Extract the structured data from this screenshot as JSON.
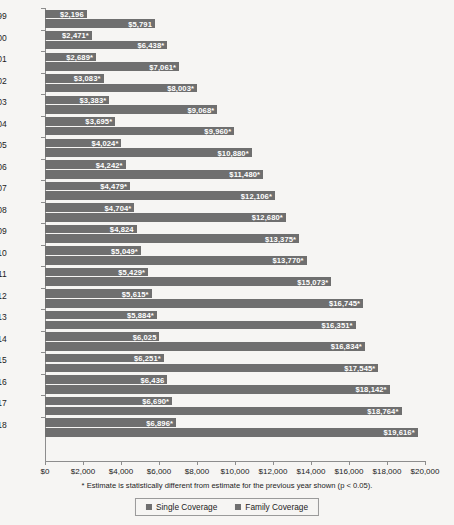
{
  "chart_data": {
    "type": "bar",
    "orientation": "horizontal",
    "title": "",
    "xlabel": "",
    "ylabel": "",
    "xlim": [
      0,
      20000
    ],
    "xticks": [
      0,
      2000,
      4000,
      6000,
      8000,
      10000,
      12000,
      14000,
      16000,
      18000,
      20000
    ],
    "xtick_labels": [
      "$0",
      "$2,000",
      "$4,000",
      "$6,000",
      "$8,000",
      "$10,000",
      "$12,000",
      "$14,000",
      "$16,000",
      "$18,000",
      "$20,000"
    ],
    "grid": false,
    "legend_position": "bottom",
    "categories": [
      "1999",
      "2000",
      "2001",
      "2002",
      "2003",
      "2004",
      "2005",
      "2006",
      "2007",
      "2008",
      "2009",
      "2010",
      "2011",
      "2012",
      "2013",
      "2014",
      "2015",
      "2016",
      "2017",
      "2018"
    ],
    "series": [
      {
        "name": "Single Coverage",
        "color": "#6f6f6f",
        "values": [
          2196,
          2471,
          2689,
          3083,
          3383,
          3695,
          4024,
          4242,
          4479,
          4704,
          4824,
          5049,
          5429,
          5615,
          5884,
          6025,
          6251,
          6436,
          6690,
          6896
        ],
        "labels": [
          "$2,196",
          "$2,471*",
          "$2,689*",
          "$3,083*",
          "$3,383*",
          "$3,695*",
          "$4,024*",
          "$4,242*",
          "$4,479*",
          "$4,704*",
          "$4,824",
          "$5,049*",
          "$5,429*",
          "$5,615*",
          "$5,884*",
          "$6,025",
          "$6,251*",
          "$6,436",
          "$6,690*",
          "$6,896*"
        ]
      },
      {
        "name": "Family Coverage",
        "color": "#6f6f6f",
        "values": [
          5791,
          6438,
          7061,
          8003,
          9068,
          9960,
          10880,
          11480,
          12106,
          12680,
          13375,
          13770,
          15073,
          16745,
          16351,
          16834,
          17545,
          18142,
          18764,
          19616
        ],
        "labels": [
          "$5,791",
          "$6,438*",
          "$7,061*",
          "$8,003*",
          "$9,068*",
          "$9,960*",
          "$10,880*",
          "$11,480*",
          "$12,106*",
          "$12,680*",
          "$13,375*",
          "$13,770*",
          "$15,073*",
          "$16,745*",
          "$16,351*",
          "$16,834*",
          "$17,545*",
          "$18,142*",
          "$18,764*",
          "$19,616*"
        ]
      }
    ],
    "annotations": {
      "footnote": "* Estimate is statistically different from estimate for the previous year shown (p < 0.05)."
    }
  },
  "legend": {
    "items": [
      {
        "label": "Single Coverage",
        "color": "#6f6f6f"
      },
      {
        "label": "Family Coverage",
        "color": "#6f6f6f"
      }
    ]
  }
}
